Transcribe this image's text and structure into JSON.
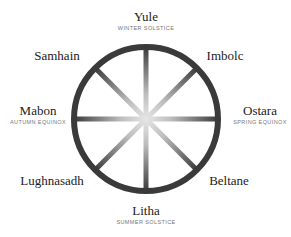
{
  "diagram": {
    "type": "wheel-of-the-year",
    "center": [
      146,
      119
    ],
    "radius": 72,
    "ring_color": "#3a3a3a",
    "spoke_color_outer": "#3a3a3a",
    "spoke_color_inner": "#e6e6e6",
    "nodes": [
      {
        "name": "Yule",
        "subtitle": "WINTER SOLSTICE",
        "position": "top"
      },
      {
        "name": "Imbolc",
        "subtitle": "",
        "position": "top-right"
      },
      {
        "name": "Ostara",
        "subtitle": "SPRING EQUINOX",
        "position": "right"
      },
      {
        "name": "Beltane",
        "subtitle": "",
        "position": "bottom-right"
      },
      {
        "name": "Litha",
        "subtitle": "SUMMER SOLSTICE",
        "position": "bottom"
      },
      {
        "name": "Lughnasadh",
        "subtitle": "",
        "position": "bottom-left"
      },
      {
        "name": "Mabon",
        "subtitle": "AUTUMN EQUINOX",
        "position": "left"
      },
      {
        "name": "Samhain",
        "subtitle": "",
        "position": "top-left"
      }
    ]
  }
}
